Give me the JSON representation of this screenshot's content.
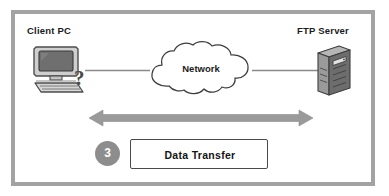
{
  "diagram": {
    "frame_color": "#a3a3a3",
    "background": "#ffffff",
    "nodes": {
      "client": {
        "label": "Client PC",
        "icon": "desktop-computer-icon",
        "annotation_glyph": "?"
      },
      "server": {
        "label": "FTP Server",
        "icon": "tower-server-icon"
      },
      "network": {
        "label": "Network",
        "icon": "cloud-icon"
      }
    },
    "step": {
      "number": "3",
      "badge_color": "#8d8d8d",
      "label": "Data Transfer"
    },
    "arrow": {
      "name": "bidirectional-data-transfer-arrow",
      "color": "#9a9a9a",
      "direction": "both"
    },
    "links": [
      {
        "from": "client",
        "to": "network",
        "color": "#8a8a8a"
      },
      {
        "from": "network",
        "to": "server",
        "color": "#8a8a8a"
      }
    ]
  }
}
